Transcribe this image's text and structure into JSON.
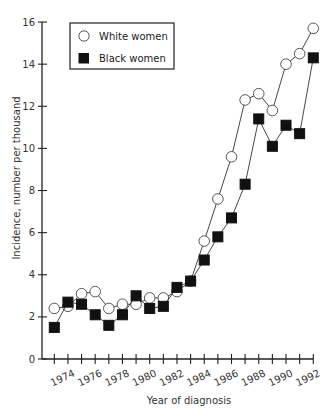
{
  "chart_data": {
    "type": "line",
    "title": "",
    "xlabel": "Year of diagnosis",
    "ylabel": "Incidence, number per thousand",
    "x": [
      1973,
      1974,
      1975,
      1976,
      1977,
      1978,
      1979,
      1980,
      1981,
      1982,
      1983,
      1984,
      1985,
      1986,
      1987,
      1988,
      1989,
      1990,
      1991,
      1992
    ],
    "x_tick_labels": [
      "1974",
      "1976",
      "1978",
      "1980",
      "1982",
      "1984",
      "1986",
      "1988",
      "1990",
      "1992"
    ],
    "y_ticks": [
      0,
      2,
      4,
      6,
      8,
      10,
      12,
      14,
      16
    ],
    "ylim": [
      0,
      16
    ],
    "xlim": [
      1972.1,
      1992
    ],
    "grid": false,
    "legend_position": "top-left",
    "series": [
      {
        "name": "White women",
        "marker": "open-circle",
        "values": [
          2.4,
          2.5,
          3.1,
          3.2,
          2.4,
          2.6,
          2.6,
          2.9,
          2.9,
          3.2,
          3.7,
          5.6,
          7.6,
          9.6,
          12.3,
          12.6,
          11.8,
          14.0,
          14.5,
          15.7
        ]
      },
      {
        "name": "Black women",
        "marker": "filled-square",
        "values": [
          1.5,
          2.7,
          2.6,
          2.1,
          1.6,
          2.1,
          3.0,
          2.4,
          2.5,
          3.4,
          3.7,
          4.7,
          5.8,
          6.7,
          8.3,
          11.4,
          10.1,
          11.1,
          10.7,
          14.3
        ]
      }
    ]
  },
  "legend": {
    "white_label": "White women",
    "black_label": "Black women"
  },
  "axes": {
    "xlabel": "Year of diagnosis",
    "ylabel": "Incidence, number per thousand"
  }
}
